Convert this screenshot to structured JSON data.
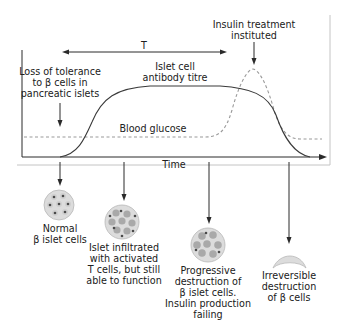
{
  "diagram": {
    "x_axis_label": "Time",
    "period_label": "T",
    "curves": {
      "antibody": {
        "label_line1": "Islet cell",
        "label_line2": "antibody titre",
        "style": "solid",
        "color": "#3a3a3a"
      },
      "glucose": {
        "label": "Blood glucose",
        "style": "dashed",
        "color": "#9a9a9a"
      }
    },
    "annotations": {
      "loss_of_tolerance": {
        "line1": "Loss of tolerance",
        "line2": "to β cells in",
        "line3": "pancreatic islets"
      },
      "insulin_treatment": {
        "line1": "Insulin treatment",
        "line2": "instituted"
      }
    },
    "stages": [
      {
        "id": "normal",
        "line1": "Normal",
        "line2": "β islet cells",
        "line3": "",
        "line4": "",
        "line5": ""
      },
      {
        "id": "infiltrated",
        "line1": "Islet infiltrated",
        "line2": "with activated",
        "line3": "T cells, but still",
        "line4": "able to function",
        "line5": ""
      },
      {
        "id": "progressive",
        "line1": "Progressive",
        "line2": "destruction of",
        "line3": "β islet cells.",
        "line4": "Insulin production",
        "line5": "failing"
      },
      {
        "id": "irreversible",
        "line1": "Irreversible",
        "line2": "destruction",
        "line3": "of β cells",
        "line4": "",
        "line5": ""
      }
    ],
    "colors": {
      "axis": "#2a2a2a",
      "cell_fill": "#d9d9d9",
      "cell_nucleus": "#555555",
      "cell_infiltrate": "#a8a8a8",
      "frame": "#bdbdbd"
    }
  }
}
